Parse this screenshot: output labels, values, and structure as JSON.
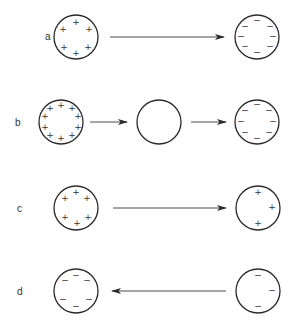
{
  "diagram": {
    "type": "charge-transfer-illustration",
    "rows": [
      {
        "label": "a",
        "label_pos": [
          45,
          40
        ],
        "spheres": [
          {
            "id": "a-left",
            "cx": 76,
            "cy": 37,
            "r": 22,
            "charges": [
              {
                "s": "+",
                "x": 76,
                "y": 22
              },
              {
                "s": "+",
                "x": 63,
                "y": 29
              },
              {
                "s": "+",
                "x": 89,
                "y": 29
              },
              {
                "s": "+",
                "x": 64,
                "y": 47
              },
              {
                "s": "+",
                "x": 88,
                "y": 47
              },
              {
                "s": "+",
                "x": 76,
                "y": 53
              }
            ]
          },
          {
            "id": "a-right",
            "cx": 257,
            "cy": 37,
            "r": 22,
            "charges": [
              {
                "s": "−",
                "x": 257,
                "y": 20
              },
              {
                "s": "−",
                "x": 245,
                "y": 26
              },
              {
                "s": "−",
                "x": 270,
                "y": 26
              },
              {
                "s": "−",
                "x": 241,
                "y": 36
              },
              {
                "s": "−",
                "x": 273,
                "y": 36
              },
              {
                "s": "−",
                "x": 245,
                "y": 46
              },
              {
                "s": "−",
                "x": 270,
                "y": 46
              },
              {
                "s": "−",
                "x": 257,
                "y": 52
              }
            ]
          }
        ],
        "arrows": [
          {
            "x1": 110,
            "y1": 37,
            "x2": 224,
            "y2": 37
          }
        ]
      },
      {
        "label": "b",
        "label_pos": [
          15,
          126
        ],
        "spheres": [
          {
            "id": "b-left",
            "cx": 61,
            "cy": 122,
            "r": 22,
            "charges": [
              {
                "s": "+",
                "x": 61,
                "y": 105
              },
              {
                "s": "+",
                "x": 50,
                "y": 108
              },
              {
                "s": "+",
                "x": 72,
                "y": 108
              },
              {
                "s": "+",
                "x": 45,
                "y": 116
              },
              {
                "s": "+",
                "x": 78,
                "y": 116
              },
              {
                "s": "+",
                "x": 45,
                "y": 127
              },
              {
                "s": "+",
                "x": 78,
                "y": 127
              },
              {
                "s": "+",
                "x": 50,
                "y": 135
              },
              {
                "s": "+",
                "x": 72,
                "y": 135
              },
              {
                "s": "+",
                "x": 61,
                "y": 138
              }
            ]
          },
          {
            "id": "b-middle",
            "cx": 159,
            "cy": 122,
            "r": 22,
            "charges": []
          },
          {
            "id": "b-right",
            "cx": 257,
            "cy": 122,
            "r": 22,
            "charges": [
              {
                "s": "−",
                "x": 257,
                "y": 104
              },
              {
                "s": "−",
                "x": 245,
                "y": 110
              },
              {
                "s": "−",
                "x": 269,
                "y": 110
              },
              {
                "s": "−",
                "x": 241,
                "y": 121
              },
              {
                "s": "−",
                "x": 273,
                "y": 121
              },
              {
                "s": "−",
                "x": 245,
                "y": 132
              },
              {
                "s": "−",
                "x": 269,
                "y": 132
              },
              {
                "s": "−",
                "x": 257,
                "y": 138
              }
            ]
          }
        ],
        "arrows": [
          {
            "x1": 90,
            "y1": 122,
            "x2": 127,
            "y2": 122
          },
          {
            "x1": 191,
            "y1": 122,
            "x2": 226,
            "y2": 122
          }
        ]
      },
      {
        "label": "c",
        "label_pos": [
          17,
          212
        ],
        "spheres": [
          {
            "id": "c-left",
            "cx": 76,
            "cy": 208,
            "r": 22,
            "charges": [
              {
                "s": "+",
                "x": 76,
                "y": 192
              },
              {
                "s": "+",
                "x": 65,
                "y": 198
              },
              {
                "s": "+",
                "x": 87,
                "y": 198
              },
              {
                "s": "+",
                "x": 65,
                "y": 217
              },
              {
                "s": "+",
                "x": 88,
                "y": 217
              },
              {
                "s": "+",
                "x": 77,
                "y": 223
              }
            ]
          },
          {
            "id": "c-right",
            "cx": 258,
            "cy": 208,
            "r": 22,
            "charges": [
              {
                "s": "+",
                "x": 258,
                "y": 192
              },
              {
                "s": "+",
                "x": 272,
                "y": 207
              },
              {
                "s": "+",
                "x": 258,
                "y": 223
              }
            ]
          }
        ],
        "arrows": [
          {
            "x1": 113,
            "y1": 208,
            "x2": 226,
            "y2": 208
          }
        ]
      },
      {
        "label": "d",
        "label_pos": [
          17,
          295
        ],
        "spheres": [
          {
            "id": "d-left",
            "cx": 76,
            "cy": 291,
            "r": 22,
            "charges": [
              {
                "s": "−",
                "x": 76,
                "y": 275
              },
              {
                "s": "−",
                "x": 65,
                "y": 280
              },
              {
                "s": "−",
                "x": 87,
                "y": 280
              },
              {
                "s": "−",
                "x": 63,
                "y": 299
              },
              {
                "s": "−",
                "x": 89,
                "y": 299
              },
              {
                "s": "−",
                "x": 76,
                "y": 306
              }
            ]
          },
          {
            "id": "d-right",
            "cx": 258,
            "cy": 291,
            "r": 22,
            "charges": [
              {
                "s": "−",
                "x": 258,
                "y": 275
              },
              {
                "s": "−",
                "x": 272,
                "y": 290
              },
              {
                "s": "−",
                "x": 258,
                "y": 306
              }
            ]
          }
        ],
        "arrows": [
          {
            "x1": 226,
            "y1": 291,
            "x2": 112,
            "y2": 291
          }
        ]
      }
    ]
  }
}
